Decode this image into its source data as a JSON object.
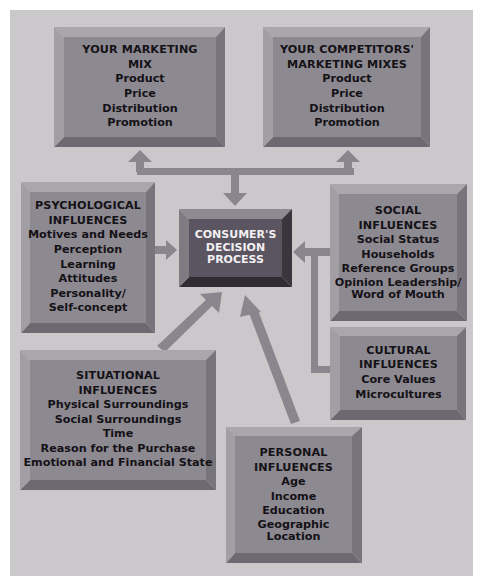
{
  "diagram": {
    "center": {
      "lines": [
        "CONSUMER'S",
        "DECISION",
        "PROCESS"
      ]
    },
    "boxes": {
      "marketing_mix": {
        "title": [
          "YOUR MARKETING",
          "MIX"
        ],
        "items": [
          "Product",
          "Price",
          "Distribution",
          "Promotion"
        ]
      },
      "competitors_mix": {
        "title": [
          "YOUR COMPETITORS'",
          "MARKETING MIXES"
        ],
        "items": [
          "Product",
          "Price",
          "Distribution",
          "Promotion"
        ]
      },
      "psychological": {
        "title": [
          "PSYCHOLOGICAL",
          "INFLUENCES"
        ],
        "items": [
          "Motives and Needs",
          "Perception",
          "Learning",
          "Attitudes",
          "Personality/",
          "Self-concept"
        ]
      },
      "social": {
        "title": [
          "SOCIAL",
          "INFLUENCES"
        ],
        "items": [
          "Social Status",
          "Households",
          "Reference Groups",
          "Opinion Leadership/",
          "Word of Mouth"
        ]
      },
      "cultural": {
        "title": [
          "CULTURAL",
          "INFLUENCES"
        ],
        "items": [
          "Core Values",
          "Microcultures"
        ]
      },
      "situational": {
        "title": [
          "SITUATIONAL",
          "INFLUENCES"
        ],
        "items": [
          "Physical Surroundings",
          "Social Surroundings",
          "Time",
          "Reason for the Purchase",
          "Emotional and Financial State"
        ]
      },
      "personal": {
        "title": [
          "PERSONAL",
          "INFLUENCES"
        ],
        "items": [
          "Age",
          "Income",
          "Education",
          "Geographic",
          "Location"
        ]
      }
    },
    "colors": {
      "panel": "#cbc8cb",
      "face": "#8d8991",
      "bevel_top": "#aaa6ab",
      "bevel_right": "#78747b",
      "bevel_bottom": "#6d6971",
      "center_face": "#5a5560",
      "center_bottom": "#2f2c33",
      "arrow": "#8a868d"
    }
  }
}
